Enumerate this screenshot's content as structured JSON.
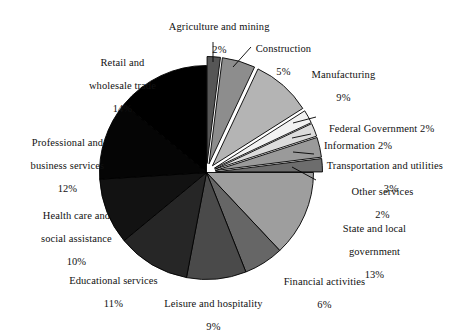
{
  "chart_data": {
    "type": "pie",
    "title": "",
    "subtitle": "",
    "xlabel": "",
    "ylabel": "",
    "legend_position": "none",
    "grid": false,
    "units": "percent",
    "total": 100,
    "categories": [
      "Agriculture and mining",
      "Construction",
      "Manufacturing",
      "Federal Government",
      "Information",
      "Transportation and utilities",
      "Other services",
      "State and local government",
      "Financial activities",
      "Leisure and hospitality",
      "Educational services",
      "Health care and social assistance",
      "Professional and business services",
      "Retail and wholesale trade"
    ],
    "values": [
      2,
      5,
      9,
      2,
      2,
      3,
      2,
      13,
      6,
      9,
      11,
      10,
      12,
      14
    ],
    "colors": [
      "#565656",
      "#8d8d8d",
      "#b4b4b4",
      "#f2f2f2",
      "#dcdcdc",
      "#9a9a9a",
      "#6d6d6d",
      "#9e9e9e",
      "#666666",
      "#4a4a4a",
      "#262626",
      "#121212",
      "#050505",
      "#000000"
    ],
    "exploded": [
      true,
      true,
      true,
      true,
      true,
      true,
      true,
      false,
      false,
      false,
      false,
      false,
      false,
      false
    ],
    "start_angle_deg": -90,
    "direction": "clockwise",
    "slices": [
      {
        "label": "Agriculture and mining",
        "value": 2,
        "value_text": "2%",
        "color": "#565656",
        "exploded": true
      },
      {
        "label": "Construction",
        "value": 5,
        "value_text": "5%",
        "color": "#8d8d8d",
        "exploded": true
      },
      {
        "label": "Manufacturing",
        "value": 9,
        "value_text": "9%",
        "color": "#b4b4b4",
        "exploded": true
      },
      {
        "label": "Federal Government",
        "value": 2,
        "value_text": "2%",
        "color": "#f2f2f2",
        "exploded": true
      },
      {
        "label": "Information",
        "value": 2,
        "value_text": "2%",
        "color": "#dcdcdc",
        "exploded": true
      },
      {
        "label": "Transportation and utilities",
        "value": 3,
        "value_text": "3%",
        "color": "#9a9a9a",
        "exploded": true
      },
      {
        "label": "Other services",
        "value": 2,
        "value_text": "2%",
        "color": "#6d6d6d",
        "exploded": true
      },
      {
        "label": "State and local government",
        "value": 13,
        "value_text": "13%",
        "color": "#9e9e9e",
        "exploded": false
      },
      {
        "label": "Financial activities",
        "value": 6,
        "value_text": "6%",
        "color": "#666666",
        "exploded": false
      },
      {
        "label": "Leisure and hospitality",
        "value": 9,
        "value_text": "9%",
        "color": "#4a4a4a",
        "exploded": false
      },
      {
        "label": "Educational services",
        "value": 11,
        "value_text": "11%",
        "color": "#262626",
        "exploded": false
      },
      {
        "label": "Health care and social assistance",
        "value": 10,
        "value_text": "10%",
        "color": "#121212",
        "exploded": false
      },
      {
        "label": "Professional and business services",
        "value": 12,
        "value_text": "12%",
        "color": "#050505",
        "exploded": false
      },
      {
        "label": "Retail and wholesale trade",
        "value": 14,
        "value_text": "14%",
        "color": "#000000",
        "exploded": false
      }
    ]
  },
  "labels": {
    "agriculture_line1": "Agriculture and mining",
    "agriculture_line2": "2%",
    "construction_line1": "Construction",
    "construction_line2": "5%",
    "manufacturing_line1": "Manufacturing",
    "manufacturing_line2": "9%",
    "federal_government": "Federal Government 2%",
    "information": "Information 2%",
    "transportation_line1": "Transportation and utilities",
    "transportation_line2": "3%",
    "other_services_line1": "Other services",
    "other_services_line2": "2%",
    "state_local_line1": "State and local",
    "state_local_line2": "government",
    "state_local_line3": "13%",
    "financial_line1": "Financial activities",
    "financial_line2": "6%",
    "leisure_line1": "Leisure and hospitality",
    "leisure_line2": "9%",
    "educational_line1": "Educational services",
    "educational_line2": "11%",
    "healthcare_line1": "Health care and",
    "healthcare_line2": "social assistance",
    "healthcare_line3": "10%",
    "professional_line1": "Professional and",
    "professional_line2": "business services",
    "professional_line3": "12%",
    "retail_line1": "Retail and",
    "retail_line2": "wholesale trade",
    "retail_line3": "14%"
  }
}
